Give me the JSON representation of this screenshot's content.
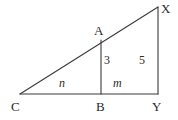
{
  "figure": {
    "background_color": "#ffffff",
    "stroke_color": "#3a3a3a",
    "text_color": "#2b2b2b"
  },
  "vertices": [
    {
      "name": "C",
      "label": "C",
      "x": 20,
      "y": 94,
      "label_x": 11,
      "label_y": 100
    },
    {
      "name": "B",
      "label": "B",
      "x": 101,
      "y": 94,
      "label_x": 96,
      "label_y": 100
    },
    {
      "name": "Y",
      "label": "Y",
      "x": 158,
      "y": 94,
      "label_x": 152,
      "label_y": 100
    },
    {
      "name": "A",
      "label": "A",
      "x": 101,
      "y": 40,
      "label_x": 94,
      "label_y": 24
    },
    {
      "name": "X",
      "label": "X",
      "x": 158,
      "y": 7,
      "label_x": 161,
      "label_y": 2
    }
  ],
  "segments": [
    {
      "name": "hypotenuse-CX",
      "from": "C",
      "to": "X",
      "x1": 20,
      "y1": 94,
      "x2": 158,
      "y2": 7
    },
    {
      "name": "base-CY",
      "from": "C",
      "to": "Y",
      "x1": 20,
      "y1": 94,
      "x2": 158,
      "y2": 94
    },
    {
      "name": "altitude-AB",
      "from": "A",
      "to": "B",
      "x1": 101,
      "y1": 40,
      "x2": 101,
      "y2": 94
    },
    {
      "name": "leg-XY",
      "from": "X",
      "to": "Y",
      "x1": 158,
      "y1": 7,
      "x2": 158,
      "y2": 94
    }
  ],
  "measure_labels": [
    {
      "name": "length-AB",
      "text": "3",
      "x": 104,
      "y": 54,
      "style": "length"
    },
    {
      "name": "length-XY",
      "text": "5",
      "x": 139,
      "y": 54,
      "style": "length"
    },
    {
      "name": "length-CB",
      "text": "n",
      "x": 59,
      "y": 77,
      "style": "var"
    },
    {
      "name": "length-BY",
      "text": "m",
      "x": 113,
      "y": 77,
      "style": "var"
    }
  ]
}
